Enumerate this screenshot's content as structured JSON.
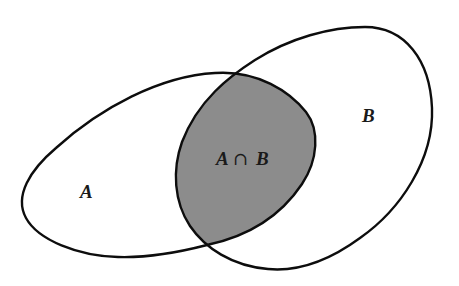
{
  "diagram": {
    "type": "venn",
    "background_color": "#ffffff",
    "stroke_color": "#0d0d0d",
    "intersection_fill": "#8c8c8c",
    "sets": [
      {
        "id": "A",
        "label": "A",
        "label_position": [
          88,
          198
        ]
      },
      {
        "id": "B",
        "label": "B",
        "label_position": [
          370,
          122
        ]
      }
    ],
    "intersection": {
      "label": "A ∩ B",
      "label_a": "A",
      "label_op": "∩",
      "label_b": "B",
      "label_position": [
        248,
        163
      ],
      "shaded": true
    }
  }
}
